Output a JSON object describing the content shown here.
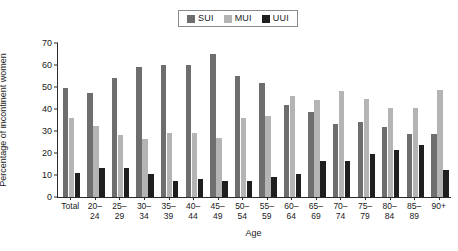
{
  "chart_data": {
    "type": "bar",
    "title": "",
    "xlabel": "Age",
    "ylabel": "Percentage of incontinent women",
    "ylim": [
      0,
      70
    ],
    "yticks": [
      0,
      10,
      20,
      30,
      40,
      50,
      60,
      70
    ],
    "grid": false,
    "legend_position": "top-center",
    "categories": [
      "Total",
      "20–\n24",
      "25–\n29",
      "30–\n34",
      "35–\n39",
      "40–\n44",
      "45–\n49",
      "50–\n54",
      "55–\n59",
      "60–\n64",
      "65–\n69",
      "70–\n74",
      "75–\n79",
      "80–\n84",
      "85–\n89",
      "90+"
    ],
    "series": [
      {
        "name": "SUI",
        "color": "#6e6e6e",
        "values": [
          49.5,
          47.5,
          54.0,
          59.0,
          60.0,
          60.0,
          65.0,
          55.0,
          52.0,
          42.0,
          38.5,
          33.0,
          34.0,
          32.0,
          28.5,
          28.5
        ]
      },
      {
        "name": "MUI",
        "color": "#b4b4b4",
        "values": [
          36.0,
          32.5,
          28.0,
          26.5,
          29.0,
          29.0,
          27.0,
          36.0,
          37.0,
          46.0,
          44.0,
          48.0,
          44.5,
          40.5,
          40.5,
          48.5
        ]
      },
      {
        "name": "UUI",
        "color": "#1f1f1f",
        "values": [
          11.0,
          13.0,
          13.0,
          10.3,
          7.5,
          8.2,
          7.3,
          7.3,
          9.3,
          10.3,
          16.3,
          16.3,
          19.5,
          21.3,
          23.5,
          12.3
        ]
      }
    ]
  },
  "legend": {
    "entries": [
      {
        "label": "SUI",
        "color": "#6e6e6e"
      },
      {
        "label": "MUI",
        "color": "#b4b4b4"
      },
      {
        "label": "UUI",
        "color": "#1f1f1f"
      }
    ]
  },
  "axes": {
    "y_title": "Percentage of incontinent women",
    "x_title": "Age",
    "y_tick_labels": [
      "70",
      "60",
      "50",
      "40",
      "30",
      "20",
      "10",
      "0"
    ]
  }
}
